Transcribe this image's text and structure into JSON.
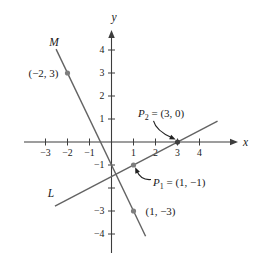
{
  "figure": {
    "bg_color": "#ffffff",
    "axis_color": "#3d3d3d",
    "line_color": "#636363",
    "point_color": "#7e7e7e",
    "annotation_color": "#222222",
    "text_color": "#1a1a1a"
  },
  "layout": {
    "width": 262,
    "height": 275,
    "origin_px": [
      111.5,
      142
    ],
    "unit_px": [
      22,
      23
    ],
    "x_axis_span_px": [
      24,
      231
    ],
    "x_arrow_tip_px": 238,
    "y_axis_span_px": [
      253,
      37
    ],
    "y_arrow_tip_px": 30,
    "x_label_px": [
      243,
      146
    ],
    "y_label_px": [
      114,
      21
    ],
    "tick_half_len": 3.5
  },
  "chart_data": {
    "type": "line",
    "title": "",
    "xlabel": "x",
    "ylabel": "y",
    "xlim": [
      -4,
      5.75
    ],
    "ylim": [
      -5,
      4.9
    ],
    "grid": false,
    "x_ticks": [
      {
        "v": -3,
        "label": "−3"
      },
      {
        "v": -2,
        "label": "−2"
      },
      {
        "v": -1,
        "label": "−1"
      },
      {
        "v": 1,
        "label": "1"
      },
      {
        "v": 2,
        "label": "2"
      },
      {
        "v": 3,
        "label": "3"
      },
      {
        "v": 4,
        "label": "4"
      }
    ],
    "y_ticks": [
      {
        "v": 4,
        "label": "4"
      },
      {
        "v": 3,
        "label": "3"
      },
      {
        "v": 2,
        "label": "2"
      },
      {
        "v": 1,
        "label": "1"
      },
      {
        "v": -1,
        "label": "−1"
      },
      {
        "v": -2,
        "label": ""
      },
      {
        "v": -3,
        "label": "−3"
      },
      {
        "v": -4,
        "label": "−4"
      }
    ],
    "series": [
      {
        "name": "M",
        "label": "M",
        "slope": -2,
        "intercept": -1,
        "x_range": [
          -2.52,
          1.55
        ],
        "label_pos": [
          -2.61,
          4.17
        ]
      },
      {
        "name": "L",
        "label": "L",
        "slope": 0.5,
        "intercept": -1.5,
        "x_range": [
          -2.57,
          4.82
        ],
        "label_pos": [
          -2.75,
          -2.39
        ]
      }
    ],
    "points": [
      {
        "name": "point-neg2-3",
        "x": -2,
        "y": 3,
        "label": "(−2, 3)",
        "anchor": "end",
        "offset": [
          -9,
          4
        ],
        "color": "#7e7e7e"
      },
      {
        "name": "point-p2-3-0",
        "x": 3,
        "y": 0,
        "var": "P",
        "sub": "2",
        "rest": " = (3, 0)",
        "label_px": [
          138,
          117
        ],
        "color": "#3f3f3f",
        "arrow": {
          "from": [
            153.5,
            120.8
          ],
          "ctrl": [
            156,
            130.5
          ],
          "to": [
            172,
            137.8
          ]
        }
      },
      {
        "name": "point-p1-1-neg1",
        "x": 1,
        "y": -1,
        "var": "P",
        "sub": "1",
        "rest": " = (1, −1)",
        "label_px": [
          153,
          186
        ],
        "color": "#7e7e7e",
        "arrow": {
          "from": [
            151,
            179.5
          ],
          "ctrl": [
            141,
            180.5
          ],
          "to": [
            136.8,
            171
          ]
        }
      },
      {
        "name": "point-1-neg3",
        "x": 1,
        "y": -3,
        "label": "(1, −3)",
        "anchor": "start",
        "offset": [
          12,
          4
        ],
        "color": "#7e7e7e"
      }
    ]
  }
}
